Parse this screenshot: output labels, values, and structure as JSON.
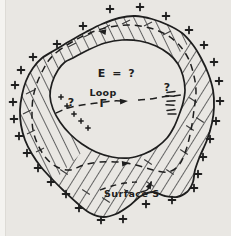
{
  "figure": {
    "labels": {
      "field": "E = ?",
      "loop_word": "Loop",
      "loop_symbol": "Γ",
      "surface": "Surface S",
      "question_left": "?",
      "question_right": "?"
    },
    "colors": {
      "paper": "#e9e7e3",
      "paper_edge": "#f4f3f0",
      "ink": "#1e1e1e",
      "hatch": "#646464"
    },
    "text_positions": {
      "field": {
        "x": 117,
        "y": 77
      },
      "loop_word": {
        "x": 103,
        "y": 96
      },
      "loop_symbol": {
        "x": 103,
        "y": 107
      },
      "surface": {
        "x": 104,
        "y": 197
      },
      "question_left": {
        "x": 71,
        "y": 106
      },
      "question_right": {
        "x": 167,
        "y": 91
      }
    },
    "geometry": {
      "outer_boundary": [
        [
          135,
          16
        ],
        [
          152,
          19
        ],
        [
          168,
          25
        ],
        [
          182,
          33
        ],
        [
          193,
          45
        ],
        [
          201,
          58
        ],
        [
          208,
          73
        ],
        [
          213,
          90
        ],
        [
          214,
          107
        ],
        [
          212,
          123
        ],
        [
          207,
          140
        ],
        [
          200,
          156
        ],
        [
          195,
          170
        ],
        [
          193,
          182
        ],
        [
          187,
          192
        ],
        [
          177,
          197
        ],
        [
          165,
          196
        ],
        [
          153,
          192
        ],
        [
          141,
          196
        ],
        [
          129,
          206
        ],
        [
          116,
          214
        ],
        [
          103,
          217
        ],
        [
          90,
          213
        ],
        [
          77,
          203
        ],
        [
          64,
          191
        ],
        [
          52,
          179
        ],
        [
          41,
          167
        ],
        [
          32,
          154
        ],
        [
          25,
          140
        ],
        [
          21,
          125
        ],
        [
          20,
          110
        ],
        [
          22,
          95
        ],
        [
          26,
          81
        ],
        [
          33,
          68
        ],
        [
          42,
          58
        ],
        [
          55,
          50
        ],
        [
          70,
          41
        ],
        [
          86,
          32
        ],
        [
          102,
          24
        ],
        [
          119,
          18
        ]
      ],
      "cavity_boundary": [
        [
          73,
          58
        ],
        [
          88,
          50
        ],
        [
          105,
          43
        ],
        [
          122,
          40
        ],
        [
          140,
          41
        ],
        [
          156,
          46
        ],
        [
          169,
          54
        ],
        [
          178,
          64
        ],
        [
          183,
          76
        ],
        [
          185,
          90
        ],
        [
          183,
          103
        ],
        [
          179,
          115
        ],
        [
          174,
          127
        ],
        [
          167,
          138
        ],
        [
          157,
          147
        ],
        [
          144,
          154
        ],
        [
          129,
          158
        ],
        [
          112,
          157
        ],
        [
          96,
          152
        ],
        [
          82,
          144
        ],
        [
          70,
          134
        ],
        [
          60,
          122
        ],
        [
          53,
          109
        ],
        [
          50,
          96
        ],
        [
          52,
          83
        ],
        [
          58,
          70
        ],
        [
          65,
          62
        ]
      ],
      "loop_ring": [
        [
          57,
          52
        ],
        [
          72,
          42
        ],
        [
          90,
          33
        ],
        [
          110,
          27
        ],
        [
          130,
          25
        ],
        [
          150,
          28
        ],
        [
          167,
          35
        ],
        [
          180,
          46
        ],
        [
          189,
          60
        ],
        [
          194,
          76
        ],
        [
          196,
          92
        ],
        [
          194,
          110
        ],
        [
          191,
          130
        ],
        [
          186,
          150
        ],
        [
          179,
          165
        ],
        [
          168,
          172
        ],
        [
          153,
          170
        ],
        [
          136,
          165
        ],
        [
          118,
          162
        ],
        [
          100,
          162
        ],
        [
          84,
          165
        ],
        [
          70,
          170
        ],
        [
          57,
          167
        ],
        [
          46,
          158
        ],
        [
          38,
          145
        ],
        [
          33,
          130
        ],
        [
          32,
          114
        ],
        [
          33,
          98
        ],
        [
          37,
          83
        ],
        [
          43,
          70
        ],
        [
          49,
          60
        ]
      ],
      "loop_chord_left": [
        [
          56,
          113
        ],
        [
          68,
          108
        ],
        [
          82,
          105
        ],
        [
          97,
          103
        ],
        [
          112,
          101
        ],
        [
          123,
          101
        ]
      ],
      "loop_chord_right": [
        [
          138,
          100
        ],
        [
          150,
          99
        ],
        [
          162,
          97
        ],
        [
          173,
          96
        ],
        [
          181,
          95
        ]
      ],
      "surface_rim": [
        [
          100,
          190
        ],
        [
          112,
          186
        ],
        [
          125,
          183
        ],
        [
          137,
          182
        ]
      ],
      "pointer_hook": [
        [
          141,
          192
        ],
        [
          147,
          190
        ],
        [
          150,
          186
        ],
        [
          151,
          182
        ]
      ]
    },
    "symbols": {
      "plus_outer": [
        [
          83,
          26
        ],
        [
          110,
          9
        ],
        [
          140,
          7
        ],
        [
          166,
          16
        ],
        [
          189,
          30
        ],
        [
          204,
          45
        ],
        [
          214,
          62
        ],
        [
          219,
          81
        ],
        [
          220,
          101
        ],
        [
          216,
          121
        ],
        [
          210,
          139
        ],
        [
          203,
          157
        ],
        [
          198,
          174
        ],
        [
          194,
          188
        ],
        [
          172,
          200
        ],
        [
          146,
          204
        ],
        [
          123,
          219
        ],
        [
          101,
          220
        ],
        [
          79,
          208
        ],
        [
          66,
          194
        ],
        [
          51,
          182
        ],
        [
          38,
          168
        ],
        [
          27,
          153
        ],
        [
          19,
          136
        ],
        [
          14,
          119
        ],
        [
          13,
          102
        ],
        [
          15,
          85
        ],
        [
          21,
          70
        ],
        [
          33,
          57
        ],
        [
          57,
          44
        ]
      ],
      "plus_inner": [
        [
          61,
          97
        ],
        [
          67,
          106
        ],
        [
          74,
          114
        ],
        [
          81,
          121
        ],
        [
          88,
          128
        ]
      ],
      "minus_ticks": [
        [
          171,
          92,
          -8
        ],
        [
          170,
          96,
          4
        ],
        [
          171,
          101,
          -5
        ],
        [
          170,
          105,
          3
        ],
        [
          171,
          110,
          -6
        ],
        [
          172,
          114,
          0
        ]
      ],
      "feather_nw": [
        [
          30,
          92
        ],
        [
          27,
          112
        ],
        [
          31,
          132
        ],
        [
          40,
          150
        ],
        [
          72,
          45
        ],
        [
          88,
          35
        ],
        [
          106,
          27
        ],
        [
          126,
          22
        ],
        [
          148,
          24
        ],
        [
          167,
          33
        ]
      ],
      "feather_se": [
        [
          193,
          100
        ],
        [
          190,
          128
        ],
        [
          184,
          152
        ],
        [
          170,
          172
        ],
        [
          150,
          184
        ],
        [
          128,
          192
        ],
        [
          106,
          200
        ],
        [
          86,
          192
        ],
        [
          64,
          172
        ],
        [
          148,
          162
        ],
        [
          200,
          120
        ]
      ],
      "arrows": [
        {
          "x": 128,
          "y": 101,
          "angle": -4
        },
        {
          "x": 98,
          "y": 31,
          "angle": 188
        },
        {
          "x": 130,
          "y": 163,
          "angle": -6
        },
        {
          "x": 152,
          "y": 181,
          "angle": -62
        }
      ]
    }
  }
}
